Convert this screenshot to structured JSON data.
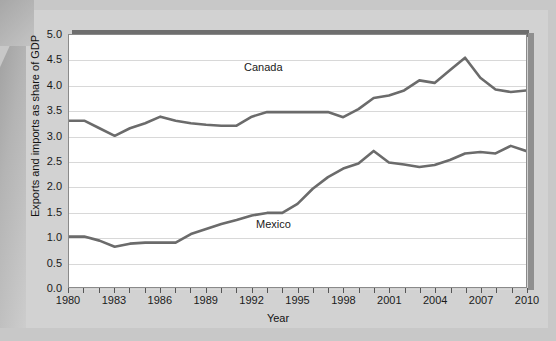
{
  "chart_data": {
    "type": "line",
    "title": "",
    "xlabel": "Year",
    "ylabel": "Exports and imports as share of GDP",
    "xlim": [
      1980,
      2010
    ],
    "ylim": [
      0.0,
      5.0
    ],
    "grid": true,
    "legend": "inline-labels",
    "ytick_labels": [
      "5.0",
      "4.5",
      "4.0",
      "3.5",
      "3.0",
      "2.5",
      "2.0",
      "1.5",
      "1.0",
      "0.5",
      "0.0"
    ],
    "ytick_values": [
      5.0,
      4.5,
      4.0,
      3.5,
      3.0,
      2.5,
      2.0,
      1.5,
      1.0,
      0.5,
      0.0
    ],
    "xtick_labels": [
      "1980",
      "1983",
      "1986",
      "1989",
      "1992",
      "1995",
      "1998",
      "2001",
      "2004",
      "2007",
      "2010"
    ],
    "xtick_values": [
      1980,
      1983,
      1986,
      1989,
      1992,
      1995,
      1998,
      2001,
      2004,
      2007,
      2010
    ],
    "x": [
      1980,
      1981,
      1982,
      1983,
      1984,
      1985,
      1986,
      1987,
      1988,
      1989,
      1990,
      1991,
      1992,
      1993,
      1994,
      1995,
      1996,
      1997,
      1998,
      1999,
      2000,
      2001,
      2002,
      2003,
      2004,
      2005,
      2006,
      2007,
      2008,
      2009,
      2010
    ],
    "series": [
      {
        "name": "Canada",
        "color": "#6b6b6b",
        "values": [
          3.3,
          3.3,
          3.15,
          3.0,
          3.15,
          3.25,
          3.38,
          3.3,
          3.25,
          3.22,
          3.2,
          3.2,
          3.38,
          3.47,
          3.47,
          3.47,
          3.47,
          3.47,
          3.37,
          3.53,
          3.75,
          3.8,
          3.9,
          4.1,
          4.05,
          4.3,
          4.55,
          4.15,
          3.92,
          3.87,
          3.9
        ]
      },
      {
        "name": "Mexico",
        "color": "#6b6b6b",
        "values": [
          1.0,
          1.0,
          0.92,
          0.8,
          0.86,
          0.88,
          0.88,
          0.88,
          1.05,
          1.15,
          1.25,
          1.33,
          1.42,
          1.47,
          1.47,
          1.65,
          1.95,
          2.18,
          2.35,
          2.45,
          2.7,
          2.47,
          2.43,
          2.38,
          2.42,
          2.52,
          2.65,
          2.68,
          2.65,
          2.8,
          2.7
        ]
      }
    ],
    "annotations": [
      {
        "text": "Canada",
        "x": 1993,
        "y": 4.15
      },
      {
        "text": "Mexico",
        "x": 1994,
        "y": 1.18
      }
    ]
  },
  "figure": {
    "axis_title_x": "Year",
    "axis_title_y": "Exports and imports as share of GDP",
    "label_canada": "Canada",
    "label_mexico": "Mexico",
    "source_note": ""
  },
  "colors": {
    "page_background": "#c8c8c8",
    "paper": "#d2d2d2",
    "plot_background": "#ffffff",
    "line": "#6b6b6b",
    "gridline": "#d8d8d8",
    "frame": "#8a8a8a",
    "top_shadow_bar": "#6e6e6e"
  }
}
